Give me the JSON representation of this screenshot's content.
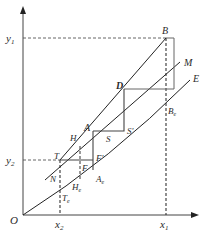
{
  "diagram": {
    "type": "geometric-construction",
    "axes": {
      "origin_label": "O",
      "x_ticks": [
        {
          "label": "x",
          "sub": "2",
          "x": 60
        },
        {
          "label": "x",
          "sub": "1",
          "x": 166
        }
      ],
      "y_ticks": [
        {
          "label": "y",
          "sub": "1",
          "y": 38
        },
        {
          "label": "y",
          "sub": "2",
          "y": 160
        }
      ]
    },
    "curves": [
      {
        "name": "upper-line",
        "label": "",
        "from": [
          60,
          160
        ],
        "to": [
          166,
          38
        ]
      },
      {
        "name": "middle-line",
        "label": "M",
        "from": [
          45,
          180
        ],
        "to": [
          180,
          62
        ]
      },
      {
        "name": "lower-curve",
        "label": "E",
        "from": [
          23,
          215
        ],
        "to": [
          190,
          80
        ]
      }
    ],
    "points": {
      "B": {
        "label": "B",
        "x": 166,
        "y": 38
      },
      "D": {
        "label": "D",
        "x": 124,
        "y": 89
      },
      "A": {
        "label": "A",
        "x": 93,
        "y": 131
      },
      "H": {
        "label": "H",
        "x": 80,
        "y": 146
      },
      "T": {
        "label": "T",
        "x": 60,
        "y": 160
      },
      "F": {
        "label": "F",
        "x": 80,
        "y": 160
      },
      "F_prime": {
        "label": "F'",
        "x": 93,
        "y": 160
      },
      "S": {
        "label": "S",
        "x": 108,
        "y": 131
      },
      "S_prime": {
        "label": "S'",
        "x": 124,
        "y": 131
      },
      "N": {
        "label": "N",
        "x": 60,
        "y": 175
      },
      "A_e": {
        "label": "A",
        "sub": "e",
        "x": 93,
        "y": 170
      },
      "H_e": {
        "label": "H",
        "sub": "e",
        "x": 80,
        "y": 180
      },
      "T_e": {
        "label": "T",
        "sub": "e",
        "x": 60,
        "y": 193
      },
      "B_e": {
        "label": "B",
        "sub": "e",
        "x": 166,
        "y": 106
      },
      "M": {
        "label": "M"
      },
      "E": {
        "label": "E"
      }
    },
    "colors": {
      "line": "#222222",
      "step_line": "#555555",
      "dashed": "#444444"
    }
  }
}
